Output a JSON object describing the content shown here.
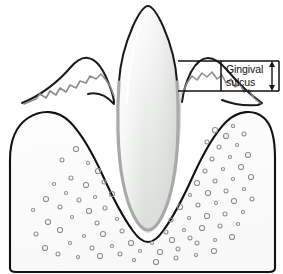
{
  "figure": {
    "type": "anatomical-line-diagram",
    "background_color": "#ffffff"
  },
  "callout": {
    "line1": "Gingival",
    "line2": "sulcus",
    "full_label": "Gingival sulcus",
    "arrow_name": "sulcus-depth-double-arrow"
  },
  "structures": {
    "crown": {
      "name": "tooth-crown",
      "fill_top": "#ffffff",
      "fill_mid": "#e9ebe9",
      "fill_bottom": "#d9dcd9",
      "stroke": "#1a1a1a"
    },
    "root": {
      "name": "tooth-root",
      "fill": "#f2f3f2",
      "stroke": "#9a9a9a"
    },
    "gingiva_left": {
      "name": "gingiva-left",
      "stroke": "#1a1a1a",
      "sulcus_stroke": "#8c8c8c"
    },
    "gingiva_right": {
      "name": "gingiva-right",
      "stroke": "#1a1a1a",
      "sulcus_stroke": "#8c8c8c"
    },
    "bone": {
      "name": "alveolar-bone",
      "fill": "#fbfbfb",
      "stroke": "#111111",
      "marrow_space_stroke": "#8e8e8e",
      "marrow_space_count": 86
    },
    "pdl": {
      "name": "periodontal-ligament-space",
      "fill": "#ffffff",
      "stroke": "#bdbdbd"
    }
  },
  "callout_box": {
    "name": "callout-leader-box",
    "stroke": "#111111",
    "top_line_y": 61,
    "bottom_line_y": 91,
    "left_x": 178,
    "right_x": 279
  },
  "marrow_spaces": [
    [
      76,
      149
    ],
    [
      62,
      160
    ],
    [
      88,
      163
    ],
    [
      98,
      171
    ],
    [
      71,
      178
    ],
    [
      54,
      184
    ],
    [
      86,
      185
    ],
    [
      104,
      182
    ],
    [
      66,
      193
    ],
    [
      46,
      199
    ],
    [
      79,
      200
    ],
    [
      95,
      197
    ],
    [
      112,
      194
    ],
    [
      60,
      207
    ],
    [
      33,
      210
    ],
    [
      89,
      211
    ],
    [
      105,
      208
    ],
    [
      72,
      217
    ],
    [
      48,
      222
    ],
    [
      97,
      223
    ],
    [
      117,
      219
    ],
    [
      60,
      230
    ],
    [
      36,
      234
    ],
    [
      84,
      236
    ],
    [
      103,
      234
    ],
    [
      122,
      231
    ],
    [
      70,
      243
    ],
    [
      45,
      248
    ],
    [
      92,
      248
    ],
    [
      112,
      246
    ],
    [
      131,
      243
    ],
    [
      58,
      254
    ],
    [
      78,
      257
    ],
    [
      100,
      256
    ],
    [
      120,
      254
    ],
    [
      140,
      251
    ],
    [
      160,
      252
    ],
    [
      178,
      249
    ],
    [
      152,
      243
    ],
    [
      172,
      240
    ],
    [
      190,
      238
    ],
    [
      134,
      260
    ],
    [
      156,
      262
    ],
    [
      176,
      258
    ],
    [
      196,
      255
    ],
    [
      214,
      251
    ],
    [
      197,
      243
    ],
    [
      215,
      240
    ],
    [
      232,
      237
    ],
    [
      166,
      232
    ],
    [
      184,
      230
    ],
    [
      202,
      228
    ],
    [
      220,
      226
    ],
    [
      238,
      224
    ],
    [
      152,
      225
    ],
    [
      171,
      220
    ],
    [
      189,
      218
    ],
    [
      207,
      216
    ],
    [
      225,
      214
    ],
    [
      243,
      212
    ],
    [
      180,
      207
    ],
    [
      198,
      205
    ],
    [
      216,
      203
    ],
    [
      234,
      201
    ],
    [
      252,
      199
    ],
    [
      190,
      195
    ],
    [
      208,
      193
    ],
    [
      226,
      191
    ],
    [
      244,
      189
    ],
    [
      197,
      183
    ],
    [
      215,
      181
    ],
    [
      233,
      179
    ],
    [
      251,
      177
    ],
    [
      205,
      171
    ],
    [
      223,
      169
    ],
    [
      241,
      167
    ],
    [
      212,
      159
    ],
    [
      230,
      157
    ],
    [
      248,
      155
    ],
    [
      219,
      147
    ],
    [
      237,
      145
    ],
    [
      226,
      136
    ],
    [
      244,
      134
    ],
    [
      233,
      126
    ],
    [
      215,
      130
    ],
    [
      207,
      142
    ]
  ]
}
